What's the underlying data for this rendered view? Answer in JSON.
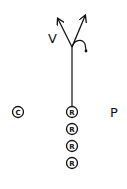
{
  "diagram": {
    "type": "play-diagram",
    "stroke_color": "#111111",
    "background": "#ffffff",
    "labels": {
      "v": "V",
      "p": "P",
      "c": "C"
    },
    "markers": [
      {
        "id": "c",
        "letter": "C",
        "circled": true
      },
      {
        "id": "r1",
        "letter": "R",
        "circled": true
      },
      {
        "id": "r2",
        "letter": "R",
        "circled": true
      },
      {
        "id": "r3",
        "letter": "R",
        "circled": true
      },
      {
        "id": "r4",
        "letter": "R",
        "circled": true
      }
    ],
    "routes": [
      {
        "name": "vertical-stem",
        "kind": "line"
      },
      {
        "name": "left-arrow",
        "kind": "arrow"
      },
      {
        "name": "right-arrow",
        "kind": "arrow"
      },
      {
        "name": "hook",
        "kind": "curve-with-dot"
      }
    ]
  }
}
